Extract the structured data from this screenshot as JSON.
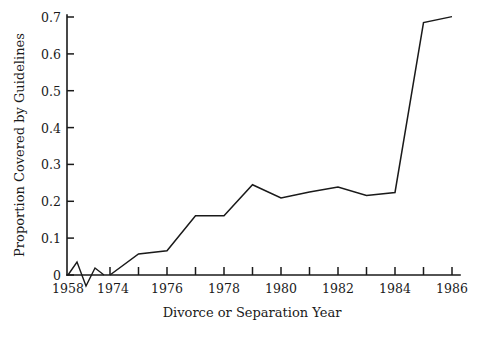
{
  "chart_data": {
    "type": "line",
    "title": "",
    "subtitle": "",
    "xlabel": "Divorce or Separation Year",
    "ylabel": "Proportion Covered by Guidelines",
    "xlim": [
      1974,
      1986
    ],
    "ylim": [
      0,
      0.7
    ],
    "grid": false,
    "legend": null,
    "axis_break": {
      "present": true,
      "between": [
        1958,
        1974
      ],
      "style": "zigzag"
    },
    "x_tick_labels": [
      "1958",
      "1974",
      "1976",
      "1978",
      "1980",
      "1982",
      "1984",
      "1986"
    ],
    "x_major_ticks": [
      1958,
      1974,
      1976,
      1978,
      1980,
      1982,
      1984,
      1986
    ],
    "x_minor_ticks": [
      1975,
      1977,
      1979,
      1981,
      1983,
      1985
    ],
    "y_tick_labels": [
      "0",
      "0.1",
      "0.2",
      "0.3",
      "0.4",
      "0.5",
      "0.6",
      "0.7"
    ],
    "y_ticks": [
      0,
      0.1,
      0.2,
      0.3,
      0.4,
      0.5,
      0.6,
      0.7
    ],
    "x": [
      1974,
      1975,
      1976,
      1977,
      1978,
      1979,
      1980,
      1981,
      1982,
      1983,
      1984,
      1985,
      1986
    ],
    "values": [
      0.0,
      0.057,
      0.066,
      0.161,
      0.161,
      0.245,
      0.209,
      0.225,
      0.239,
      0.216,
      0.224,
      0.685,
      0.701
    ],
    "series": [
      {
        "name": "Proportion Covered by Guidelines",
        "color": "#1a1a1a",
        "values": [
          0.0,
          0.057,
          0.066,
          0.161,
          0.161,
          0.245,
          0.209,
          0.225,
          0.239,
          0.216,
          0.224,
          0.685,
          0.701
        ]
      }
    ]
  },
  "colors": {
    "background": "#ffffff",
    "ink": "#1a1a1a",
    "line": "#1a1a1a"
  }
}
